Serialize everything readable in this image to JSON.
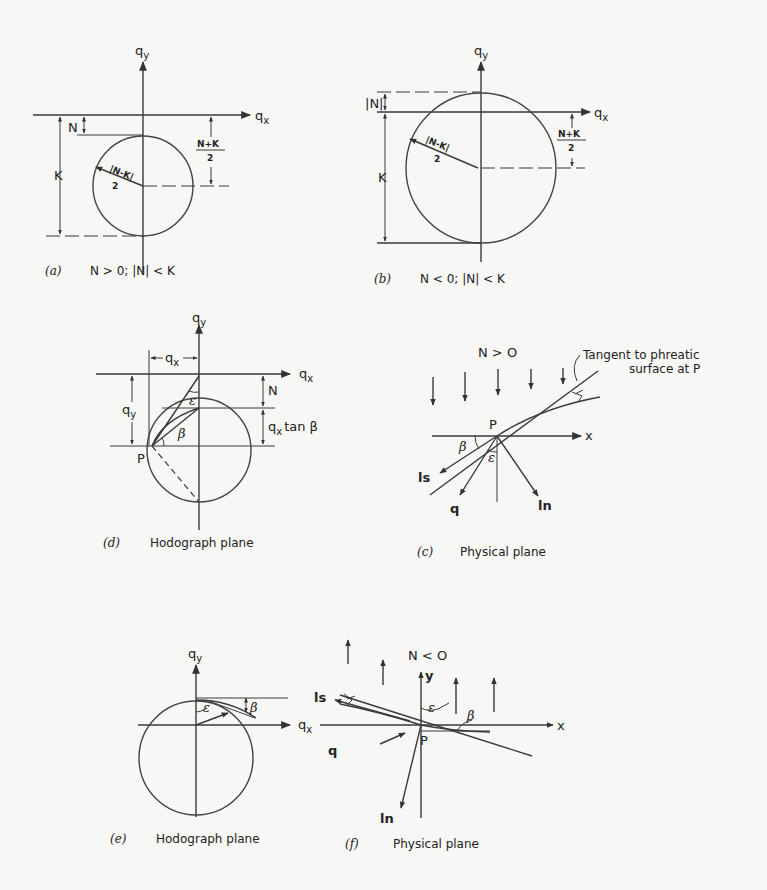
{
  "figure": {
    "background": "#f7f7f5",
    "ink": "#2a2a2a",
    "panels": {
      "a": {
        "axis_y": "q",
        "axis_y_sub": "y",
        "axis_x": "q",
        "axis_x_sub": "x",
        "label_N": "N",
        "label_K": "K",
        "radius_num": "|N-K|",
        "radius_den": "2",
        "center_num": "N+K",
        "center_den": "2",
        "caption_tag": "(a)",
        "caption_text": "N > 0;  |N| < K"
      },
      "b": {
        "axis_y": "q",
        "axis_y_sub": "y",
        "axis_x": "q",
        "axis_x_sub": "x",
        "label_N": "|N|",
        "label_K": "K",
        "radius_num": "|N-K|",
        "radius_den": "2",
        "center_num": "N+K",
        "center_den": "2",
        "caption_tag": "(b)",
        "caption_text": "N < 0;  |N| < K"
      },
      "d": {
        "axis_y": "q",
        "axis_y_sub": "y",
        "axis_x": "q",
        "axis_x_sub": "x",
        "dim_qx": "q",
        "dim_qx_sub": "x",
        "dim_qy": "q",
        "dim_qy_sub": "y",
        "label_N": "N",
        "label_qxtanb": "q",
        "label_qxtanb_sub": "x",
        "label_qxtanb_rest": "tan β",
        "label_beta": "β",
        "label_eps": "ε",
        "label_P": "P",
        "caption_tag": "(d)",
        "caption_text": "Hodograph plane"
      },
      "c": {
        "title": "N > O",
        "annotation_line1": "Tangent to phreatic",
        "annotation_line2": "surface at P",
        "label_P": "P",
        "label_x": "x",
        "label_beta": "β",
        "label_eps": "ε",
        "label_ls": "ls",
        "label_q": "q",
        "label_ln": "ln",
        "caption_tag": "(c)",
        "caption_text": "Physical plane"
      },
      "e": {
        "axis_y": "q",
        "axis_y_sub": "y",
        "axis_x": "q",
        "axis_x_sub": "x",
        "label_beta": "β",
        "label_eps": "ε",
        "caption_tag": "(e)",
        "caption_text": "Hodograph plane"
      },
      "f": {
        "title": "N < O",
        "label_y": "y",
        "label_x": "x",
        "label_P": "P",
        "label_beta": "β",
        "label_eps": "ε",
        "label_ls": "ls",
        "label_q": "q",
        "label_ln": "ln",
        "caption_tag": "(f)",
        "caption_text": "Physical plane"
      }
    }
  }
}
